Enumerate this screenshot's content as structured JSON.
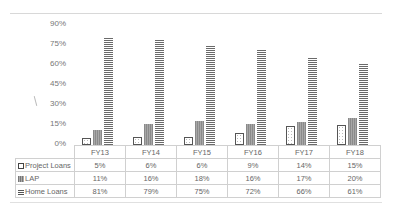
{
  "chart_data": {
    "type": "bar",
    "title": "",
    "xlabel": "",
    "ylabel": "",
    "categories": [
      "FY13",
      "FY14",
      "FY15",
      "FY16",
      "FY17",
      "FY18"
    ],
    "series": [
      {
        "name": "Project Loans",
        "values": [
          5,
          6,
          6,
          9,
          14,
          15
        ],
        "labels": [
          "5%",
          "6%",
          "6%",
          "9%",
          "14%",
          "15%"
        ],
        "pattern": "dotted-outline"
      },
      {
        "name": "LAP",
        "values": [
          11,
          16,
          18,
          16,
          17,
          20
        ],
        "labels": [
          "11%",
          "16%",
          "18%",
          "16%",
          "17%",
          "20%"
        ],
        "pattern": "vertical-stripes"
      },
      {
        "name": "Home Loans",
        "values": [
          81,
          79,
          75,
          72,
          66,
          61
        ],
        "labels": [
          "81%",
          "79%",
          "75%",
          "72%",
          "66%",
          "61%"
        ],
        "pattern": "horizontal-stripes"
      }
    ],
    "yticks": [
      "0%",
      "15%",
      "30%",
      "45%",
      "60%",
      "75%",
      "90%"
    ],
    "ylim": [
      0,
      90
    ],
    "grid": false,
    "legend_position": "data-table"
  },
  "axis": {
    "yticks": [
      "90%",
      "75%",
      "60%",
      "45%",
      "30%",
      "15%",
      "0%"
    ]
  },
  "table": {
    "headers": [
      "FY13",
      "FY14",
      "FY15",
      "FY16",
      "FY17",
      "FY18"
    ],
    "rows": [
      {
        "label": "Project Loans",
        "cells": [
          "5%",
          "6%",
          "6%",
          "9%",
          "14%",
          "15%"
        ]
      },
      {
        "label": "LAP",
        "cells": [
          "11%",
          "16%",
          "18%",
          "16%",
          "17%",
          "20%"
        ]
      },
      {
        "label": "Home Loans",
        "cells": [
          "81%",
          "79%",
          "75%",
          "72%",
          "66%",
          "61%"
        ]
      }
    ]
  }
}
